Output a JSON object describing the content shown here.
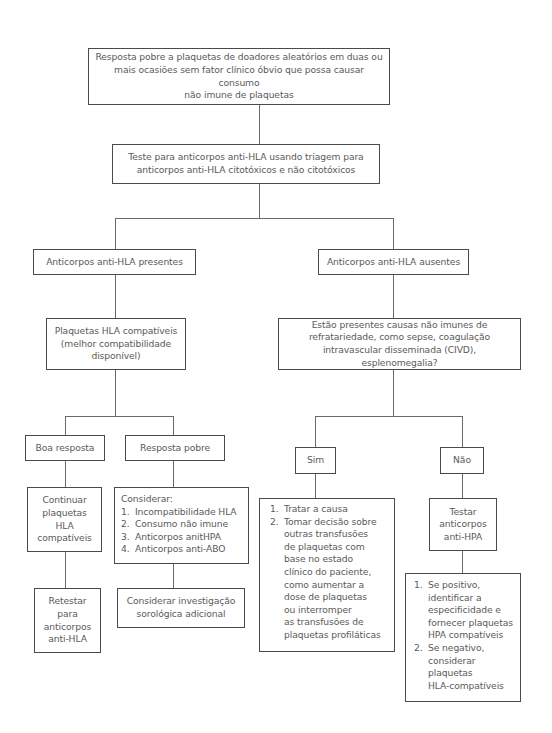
{
  "diagram": {
    "nodes": {
      "start": {
        "text": "Resposta pobre a plaquetas de doadores aleatórios em duas ou\nmais ocasiões sem fator clínico óbvio que possa causar consumo\nnão imune de plaquetas"
      },
      "test_hla": {
        "text": "Teste para anticorpos anti-HLA usando triagem para\nanticorpos anti-HLA citotóxicos e não citotóxicos"
      },
      "hla_present": {
        "text": "Anticorpos anti-HLA presentes"
      },
      "hla_absent": {
        "text": "Anticorpos anti-HLA ausentes"
      },
      "hla_compatible": {
        "text": "Plaquetas HLA compatíveis\n(melhor compatibilidade\ndisponível)"
      },
      "nonimmune_question": {
        "text": "Estão presentes causas não imunes de\nrefratariedade, como sepse, coagulação\nintravascular disseminada (CIVD), esplenomegalia?"
      },
      "good_response": {
        "text": "Boa resposta"
      },
      "poor_response": {
        "text": "Resposta pobre"
      },
      "yes": {
        "text": "Sim"
      },
      "no": {
        "text": "Não"
      },
      "continue_hla": {
        "text": "Continuar\nplaquetas\nHLA\ncompatíveis"
      },
      "consider": {
        "heading": "Considerar:",
        "items": [
          {
            "num": "1.",
            "text": "Incompatibilidade HLA"
          },
          {
            "num": "2.",
            "text": "Consumo não imune"
          },
          {
            "num": "3.",
            "text": "Anticorpos anitHPA"
          },
          {
            "num": "4.",
            "text": "Anticorpos anti-ABO"
          }
        ]
      },
      "treat_cause": {
        "items": [
          {
            "num": "1.",
            "text": "Tratar a causa"
          },
          {
            "num": "2.",
            "text": "Tomar decisão sobre\noutras transfusões\nde plaquetas com\nbase no estado\nclínico do paciente,\ncomo aumentar a\ndose de plaquetas\nou interromper\nas transfusões de\nplaquetas profiláticas"
          }
        ]
      },
      "test_hpa": {
        "text": "Testar\nanticorpos\nanti-HPA"
      },
      "retest_hla": {
        "text": "Retestar\npara\nanticorpos\nanti-HLA"
      },
      "serologic": {
        "text": "Considerar investigação\nsorológica adicional"
      },
      "hpa_result": {
        "items": [
          {
            "num": "1.",
            "text": "Se positivo,\nidentificar a\nespecificidade e\nfornecer plaquetas\nHPA compatíveis"
          },
          {
            "num": "2.",
            "text": "Se negativo,\nconsiderar\nplaquetas\nHLA-compatíveis"
          }
        ]
      }
    },
    "colors": {
      "border": "#4a4a4a",
      "text": "#5a5a5a",
      "connector": "#6a6a6a",
      "background": "#ffffff"
    }
  }
}
